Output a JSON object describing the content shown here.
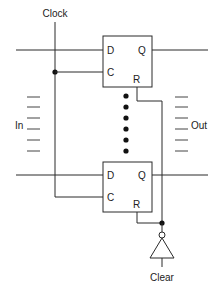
{
  "diagram": {
    "type": "circuit-schematic",
    "labels": {
      "clock": "Clock",
      "input": "In",
      "output": "Out",
      "clear": "Clear"
    },
    "flip_flops": [
      {
        "id": "top",
        "pins": {
          "d": "D",
          "c": "C",
          "q": "Q",
          "r": "R"
        }
      },
      {
        "id": "bottom",
        "pins": {
          "d": "D",
          "c": "C",
          "q": "Q",
          "r": "R"
        }
      }
    ],
    "ellipsis_dots": 6,
    "input_dashes": 6,
    "output_dashes": 6,
    "inverter": {
      "label": "Clear",
      "has_bubble": true
    }
  },
  "colors": {
    "wire": "#2a2a2a",
    "background": "#ffffff"
  }
}
